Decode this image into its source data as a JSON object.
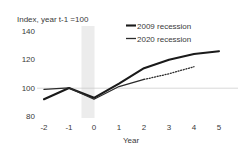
{
  "chart_data": {
    "type": "line",
    "title": "",
    "subtitle": "Index,  year t-1 =100",
    "xlabel": "Year",
    "ylabel": "",
    "x": [
      -2,
      -1,
      0,
      1,
      2,
      3,
      4,
      5
    ],
    "xticklabels": [
      "-2",
      "-1",
      "0",
      "1",
      "2",
      "3",
      "4",
      "5"
    ],
    "yticks": [
      80,
      100,
      120,
      140
    ],
    "yticklabels": [
      "80",
      "100",
      "120",
      "140"
    ],
    "ylim": [
      76,
      144
    ],
    "xlim": [
      -2.4,
      5.4
    ],
    "grid": "y-gridline at 100 only",
    "legend_position": "top-right inside axes",
    "annotations": [
      {
        "name": "recession-band",
        "type": "vertical-band",
        "x_start": -0.3,
        "x_end": 0.3,
        "color": "#ececec"
      }
    ],
    "series": [
      {
        "name": "2009 recession",
        "style": "solid",
        "color": "#1a1a1a",
        "x": [
          -2,
          -1,
          0,
          1,
          2,
          3,
          4,
          5
        ],
        "values": [
          92,
          100,
          93,
          103,
          114,
          120,
          124,
          126
        ]
      },
      {
        "name": "2020 recession",
        "style": "solid-then-dotted",
        "color": "#2b2b2b",
        "x": [
          -2,
          -1,
          0,
          1,
          2
        ],
        "values": [
          99,
          100,
          92,
          101,
          106
        ],
        "projection": {
          "label": "dotted projection",
          "style": "dotted",
          "x": [
            2,
            3,
            4
          ],
          "values": [
            106,
            110,
            115
          ]
        }
      }
    ]
  },
  "legend": {
    "items": [
      {
        "label": "2009 recession",
        "color": "#1a1a1a"
      },
      {
        "label": "2020 recession",
        "color": "#2b2b2b"
      }
    ]
  },
  "axes": {
    "subtitle": "Index,  year t-1 =100",
    "xlabel": "Year",
    "yticklabels": [
      "140",
      "120",
      "100",
      "80"
    ],
    "xticklabels": [
      "-2",
      "-1",
      "0",
      "1",
      "2",
      "3",
      "4",
      "5"
    ]
  }
}
